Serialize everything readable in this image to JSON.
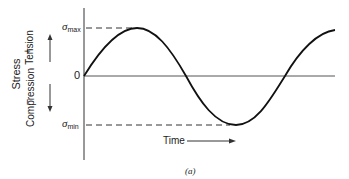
{
  "figure": {
    "caption": "(a)",
    "y_axis": {
      "title": "Stress",
      "positive_label": "Tension",
      "positive_sign": "+",
      "negative_label": "Compression",
      "negative_sign": "−",
      "zero_label": "0",
      "max_symbol": "σ",
      "max_sub": "max",
      "min_symbol": "σ",
      "min_sub": "min"
    },
    "x_axis": {
      "title": "Time"
    },
    "curve": {
      "type": "sinusoid",
      "description": "Cyclic stress vs time, starting at 0, rising to sigma_max, falling through 0 to sigma_min, rising back"
    }
  }
}
